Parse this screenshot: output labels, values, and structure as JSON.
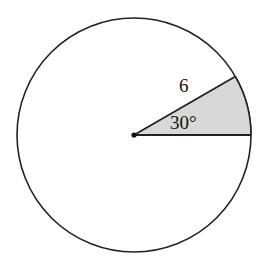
{
  "diagram": {
    "type": "circle-sector",
    "circle": {
      "cx": 134,
      "cy": 135,
      "r": 117,
      "stroke": "#222222",
      "fill": "#ffffff"
    },
    "sector": {
      "angle_deg": 30,
      "fill": "#d8d8d8"
    },
    "labels": {
      "radius": "6",
      "angle": "30°"
    }
  }
}
